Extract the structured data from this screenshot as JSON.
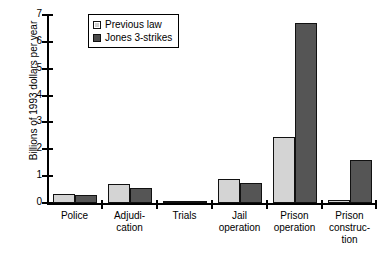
{
  "chart_data": {
    "type": "bar",
    "title": "",
    "xlabel": "",
    "ylabel": "Billions of 1993 dollars per year",
    "ylim": [
      0,
      7
    ],
    "yticks": [
      0,
      1,
      2,
      3,
      4,
      5,
      6,
      7
    ],
    "grid": false,
    "legend_position": "top-left-inside",
    "categories": [
      "Police",
      "Adjudi-\ncation",
      "Trials",
      "Jail\noperation",
      "Prison\noperation",
      "Prison\nconstruc-\ntion"
    ],
    "category_lines": [
      [
        "Police"
      ],
      [
        "Adjudi-",
        "cation"
      ],
      [
        "Trials"
      ],
      [
        "Jail",
        "operation"
      ],
      [
        "Prison",
        "operation"
      ],
      [
        "Prison",
        "construc-",
        "tion"
      ]
    ],
    "series": [
      {
        "name": "Previous law",
        "color": "#d4d4d4",
        "values": [
          0.33,
          0.7,
          0.03,
          0.9,
          2.46,
          0.13
        ]
      },
      {
        "name": "Jones 3-strikes",
        "color": "#555555",
        "values": [
          0.28,
          0.57,
          0.03,
          0.76,
          6.72,
          1.62
        ]
      }
    ]
  },
  "legend": {
    "items": [
      {
        "label": "Previous law",
        "swatch": "light-gray-square"
      },
      {
        "label": "Jones 3-strikes",
        "swatch": "dark-gray-square"
      }
    ]
  },
  "axis": {
    "y_title": "Billions of 1993 dollars per year",
    "y_tick_labels": [
      "7",
      "6",
      "5",
      "4",
      "3",
      "2",
      "1",
      "0"
    ]
  },
  "colors": {
    "previous_law": "#d4d4d4",
    "jones_3_strikes": "#555555",
    "axis": "#000000",
    "background": "#ffffff"
  }
}
